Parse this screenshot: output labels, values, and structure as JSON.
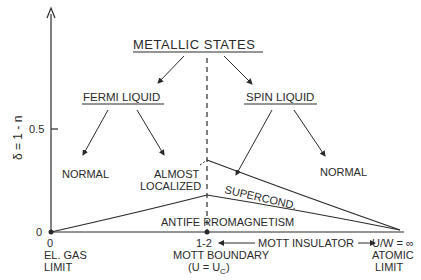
{
  "title": "METALLIC STATES",
  "branches": {
    "left": "FERMI LIQUID",
    "right": "SPIN LIQUID"
  },
  "leaves": {
    "left_normal": "NORMAL",
    "almost_1": "ALMOST",
    "almost_2": "LOCALIZED",
    "right_normal": "NORMAL"
  },
  "regions": {
    "supercond": "SUPERCOND.",
    "afm": "ANTIFE RROMAGNETISM",
    "mott_insulator": "MOTT INSULATOR"
  },
  "axis": {
    "ylabel": "δ = 1 - n",
    "y_tick": "0.5",
    "y_zero": "0",
    "x_zero": "0",
    "x_mid": "1-2",
    "x_end": "U/W = ∞"
  },
  "x_labels": {
    "left_1": "EL. GAS",
    "left_2": "LIMIT",
    "mid_1": "MOTT BOUNDARY",
    "mid_2": "(U = U",
    "mid_sub": "C",
    "mid_3": ")",
    "right_1": "ATOMIC",
    "right_2": "LIMIT"
  },
  "colors": {
    "ink": "#2a2a2a",
    "background": "#ffffff"
  }
}
